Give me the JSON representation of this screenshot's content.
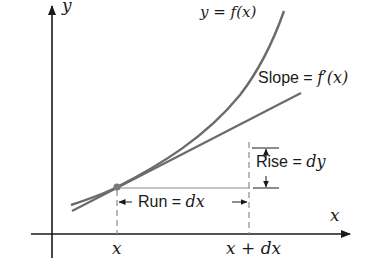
{
  "diagram": {
    "axes": {
      "x_label": "x",
      "y_label": "y"
    },
    "curve_label": "y = f(x)",
    "tangent_label": "Slope = f′(x)",
    "rise_label_text": "Rise = ",
    "rise_label_var": "dy",
    "run_label_text": "Run = ",
    "run_label_var": "dx",
    "tick_x": "x",
    "tick_x_plus_dx": "x + dx",
    "colors": {
      "curve": "#6b6b6b",
      "tangent": "#6b6b6b",
      "axes": "#1a1a1a",
      "guides": "#8a8a8a",
      "point": "#7a7a7a",
      "text": "#1a1a1a"
    }
  }
}
